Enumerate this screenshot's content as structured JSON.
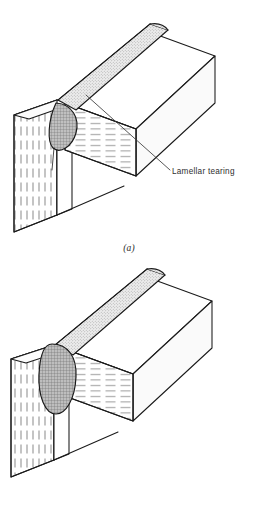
{
  "document": {
    "title": "Lamellar tearing in welded T-joints",
    "background_color": "#ffffff",
    "line_color": "#1a1a1a"
  },
  "figures": [
    {
      "id": "a",
      "caption": "(a)",
      "annotation": {
        "text": "Lamellar tearing",
        "name": "lamellar-tearing-label",
        "leader_line": true
      },
      "tear_shape": "teardrop",
      "weld_fill": "stipple",
      "parts": {
        "vertical_plate": "vertical dashed lamellae",
        "horizontal_beam": "horizontal dashed lamellae",
        "weld_bead": "stippled band along joint"
      }
    },
    {
      "id": "b",
      "caption": "(b)",
      "annotation": null,
      "tear_shape": "elongated-oval",
      "weld_fill": "stipple",
      "parts": {
        "vertical_plate": "vertical dashed lamellae",
        "horizontal_beam": "horizontal dashed lamellae",
        "weld_bead": "stippled band along joint"
      }
    }
  ],
  "colors": {
    "outline": "#1a1a1a",
    "face_light": "#ffffff",
    "face_shade": "#f2f2f2",
    "weld_stipple_bg": "#e8e8e8",
    "tear_fill": "#b8b8b8",
    "hatch_line": "#555555"
  }
}
